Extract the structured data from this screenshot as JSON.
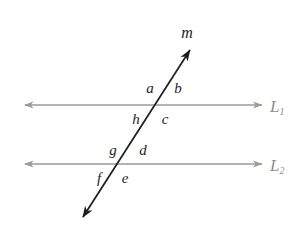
{
  "figure": {
    "type": "geometry-diagram",
    "background_color": "#ffffff",
    "parallel_line_color": "#9a9a9a",
    "transversal_color": "#1d1d1d",
    "label_color": "#1d1d1d",
    "line_label_color": "#8e8e8e"
  },
  "lines": {
    "parallel": [
      {
        "id": "L1",
        "label": "L",
        "subscript": "1",
        "y": 105,
        "x_start": 25,
        "x_end": 262,
        "label_x": 270,
        "label_y": 106,
        "arrow_start": true,
        "arrow_end": true
      },
      {
        "id": "L2",
        "label": "L",
        "subscript": "2",
        "y": 164,
        "x_start": 25,
        "x_end": 262,
        "label_x": 270,
        "label_y": 165,
        "arrow_start": true,
        "arrow_end": true
      }
    ],
    "transversal": {
      "id": "m",
      "label": "m",
      "label_x": 187,
      "label_y": 33,
      "x_top": 190,
      "y_top": 50,
      "x_bottom": 83,
      "y_bottom": 217,
      "arrow_top": true,
      "arrow_bottom": true
    }
  },
  "intersections": [
    {
      "id": "intersection-L1",
      "x": 158,
      "y": 105
    },
    {
      "id": "intersection-L2",
      "x": 122,
      "y": 164
    }
  ],
  "angle_labels": [
    {
      "id": "a",
      "text": "a",
      "x": 150,
      "y": 88
    },
    {
      "id": "b",
      "text": "b",
      "x": 178,
      "y": 88
    },
    {
      "id": "c",
      "text": "c",
      "x": 165,
      "y": 119
    },
    {
      "id": "d",
      "text": "d",
      "x": 143,
      "y": 150
    },
    {
      "id": "e",
      "text": "e",
      "x": 125,
      "y": 178
    },
    {
      "id": "f",
      "text": "f",
      "x": 99,
      "y": 178
    },
    {
      "id": "g",
      "text": "g",
      "x": 113,
      "y": 150
    },
    {
      "id": "h",
      "text": "h",
      "x": 136,
      "y": 119
    }
  ]
}
